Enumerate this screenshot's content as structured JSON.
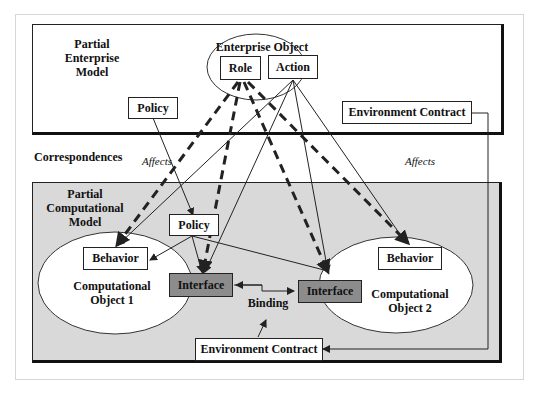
{
  "enterprise_model": {
    "title": "Partial Enterprise Model",
    "title_lines": [
      "Partial",
      "Enterprise",
      "Model"
    ],
    "enterprise_object": {
      "label": "Enterprise Object",
      "role": "Role",
      "action": "Action"
    },
    "policy": "Policy",
    "environment_contract": "Environment Contract"
  },
  "correspondences": {
    "label": "Correspondences",
    "affects_left": "Affects",
    "affects_right": "Affects"
  },
  "computational_model": {
    "title_lines": [
      "Partial",
      "Computational",
      "Model"
    ],
    "policy": "Policy",
    "object1": {
      "behavior": "Behavior",
      "name_lines": [
        "Computational",
        "Object 1"
      ],
      "interface": "Interface"
    },
    "object2": {
      "behavior": "Behavior",
      "name_lines": [
        "Computational",
        "Object 2"
      ],
      "interface": "Interface"
    },
    "binding": "Binding",
    "environment_contract": "Environment Contract"
  },
  "colors": {
    "panel_fill": "#d9d9d9",
    "interface_fill": "#8c8c8c",
    "line": "#222222"
  }
}
